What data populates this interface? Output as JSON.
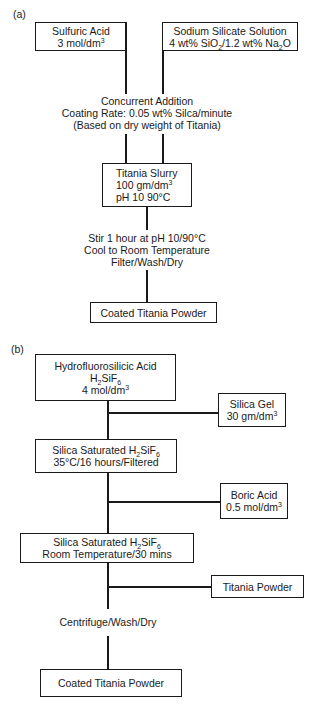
{
  "panel_a": {
    "label": "(a)",
    "sulfuric_acid": {
      "line1": "Sulfuric Acid",
      "line2_pre": "3 mol/dm",
      "line2_sup": "3"
    },
    "sodium_silicate": {
      "line1": "Sodium Silicate Solution",
      "line2_a": "4 wt% SiO",
      "line2_sub1": "2",
      "line2_b": "/1.2 wt% Na",
      "line2_sub2": "2",
      "line2_c": "O"
    },
    "concurrent": {
      "line1": "Concurrent Addition",
      "line2": "Coating Rate: 0.05 wt% Silca/minute",
      "line3": "(Based on dry weight of Titania)"
    },
    "slurry": {
      "line1": "Titania Slurry",
      "line2_pre": "100 gm/dm",
      "line2_sup": "3",
      "line3": "pH 10  90°C"
    },
    "process": {
      "line1": "Stir 1 hour at pH 10/90°C",
      "line2": "Cool to Room Temperature",
      "line3": "Filter/Wash/Dry"
    },
    "product": "Coated Titania Powder"
  },
  "panel_b": {
    "label": "(b)",
    "hydro": {
      "line1": "Hydrofluorosilicic Acid",
      "f_a": "H",
      "f_s1": "2",
      "f_b": "SiF",
      "f_s2": "6",
      "line3_pre": "4 mol/dm",
      "line3_sup": "3"
    },
    "silica_gel": {
      "line1": "Silica Gel",
      "line2_pre": "30 gm/dm",
      "line2_sup": "3"
    },
    "saturated1": {
      "pre": "Silica Saturated H",
      "s1": "2",
      "mid": "SiF",
      "s2": "6",
      "line2": "35°C/16 hours/Filtered"
    },
    "boric": {
      "line1": "Boric Acid",
      "line2_pre": "0.5 mol/dm",
      "line2_sup": "3"
    },
    "saturated2": {
      "pre": "Silica Saturated H",
      "s1": "2",
      "mid": "SiF",
      "s2": "6",
      "line2": "Room Temperature/30 mins"
    },
    "titania_powder": "Titania Powder",
    "centrifuge": "Centrifuge/Wash/Dry",
    "product": "Coated Titania Powder"
  }
}
